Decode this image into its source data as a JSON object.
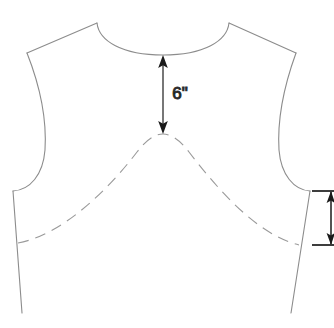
{
  "diagram": {
    "background_color": "#ffffff",
    "outline_color": "#8c8c8c",
    "dash_color": "#9a9a9a",
    "dimension_color": "#1a1a1a",
    "pieces": [
      {
        "name": "bodice-front-outline",
        "style": "solid",
        "description": "Cut edge of bodice front: neckline, shoulders, armholes, side seams"
      },
      {
        "name": "original-neckline-guide",
        "style": "dashed",
        "description": "Dashed arch marking the original/underlying neckline or yoke line"
      }
    ],
    "dimensions": [
      {
        "name": "neckline-drop",
        "label": "6\"",
        "value": 6,
        "unit": "inch",
        "orientation": "vertical",
        "arrow_style": "double",
        "from_y": 55,
        "to_y": 134,
        "x": 163,
        "label_x": 180,
        "label_y": 95
      },
      {
        "name": "side-seam-dimension",
        "label": "",
        "orientation": "vertical",
        "arrow_style": "double",
        "from_y": 191,
        "to_y": 245,
        "x": 331,
        "extension_line_left_x": 312,
        "extension_line_right_x": 333
      }
    ],
    "geometry": {
      "neckline_center_bottom": [
        163,
        55
      ],
      "left_shoulder_neck_point": [
        97,
        23
      ],
      "right_shoulder_neck_point": [
        229,
        23
      ],
      "left_shoulder_tip": [
        27,
        53
      ],
      "right_shoulder_tip": [
        296,
        53
      ],
      "left_underarm": [
        13,
        191
      ],
      "right_underarm": [
        310,
        191
      ],
      "left_hem_point": [
        22,
        313
      ],
      "right_hem_point": [
        291,
        313
      ],
      "dashed_arch_peak": [
        163,
        134
      ],
      "dashed_arch_left_end": [
        18,
        243
      ],
      "dashed_arch_right_end": [
        299,
        245
      ]
    }
  }
}
